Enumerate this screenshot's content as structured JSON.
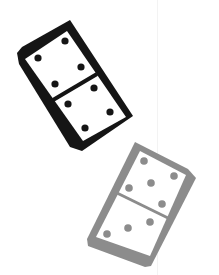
{
  "illustration": {
    "description": "Two dominoes",
    "background": "#ffffff",
    "guide_line_color": "#f3f3f3"
  },
  "dominoes": [
    {
      "name": "black-domino",
      "color": "#151515",
      "face_color": "#ffffff",
      "pips_top": 4,
      "pips_bottom": 4
    },
    {
      "name": "gray-domino",
      "color": "#8c8c8c",
      "face_color": "#ffffff",
      "pips_top": 5,
      "pips_bottom": 3
    }
  ]
}
